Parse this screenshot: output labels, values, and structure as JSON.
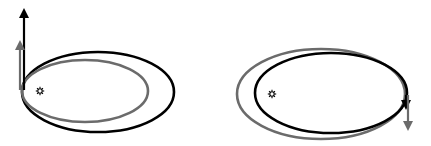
{
  "diagram": {
    "panels": [
      {
        "id": "left",
        "label": "Velocity boost at perihelion",
        "sun": {
          "x": 40,
          "y": 91
        },
        "orbits": [
          {
            "name": "outer-orbit",
            "color": "#000000",
            "cx": 98,
            "cy": 92,
            "rx": 76,
            "ry": 40,
            "stroke_width": 2.6
          },
          {
            "name": "inner-orbit",
            "color": "#6b6b6b",
            "cx": 85,
            "cy": 91,
            "rx": 63,
            "ry": 31,
            "stroke_width": 2.6
          }
        ],
        "arrows": [
          {
            "name": "long-velocity-arrow",
            "color": "#000000",
            "x1": 24,
            "y1": 90,
            "x2": 24,
            "y2": 8,
            "direction": "up"
          },
          {
            "name": "short-velocity-arrow",
            "color": "#6b6b6b",
            "x1": 20,
            "y1": 90,
            "x2": 20,
            "y2": 40,
            "direction": "up"
          }
        ]
      },
      {
        "id": "right",
        "label": "Velocity change at aphelion",
        "sun": {
          "x": 272,
          "y": 94
        },
        "orbits": [
          {
            "name": "outer-orbit",
            "color": "#6b6b6b",
            "cx": 321,
            "cy": 94,
            "rx": 84,
            "ry": 45,
            "stroke_width": 2.6
          },
          {
            "name": "inner-orbit",
            "color": "#000000",
            "cx": 331,
            "cy": 93,
            "rx": 76,
            "ry": 40,
            "stroke_width": 2.6
          }
        ],
        "arrows": [
          {
            "name": "short-velocity-arrow",
            "color": "#000000",
            "x1": 406,
            "y1": 95,
            "x2": 406,
            "y2": 110,
            "direction": "down"
          },
          {
            "name": "long-velocity-arrow",
            "color": "#6b6b6b",
            "x1": 408,
            "y1": 95,
            "x2": 408,
            "y2": 131,
            "direction": "down"
          }
        ]
      }
    ],
    "colors": {
      "primary": "#000000",
      "secondary": "#6b6b6b",
      "background": "#ffffff"
    }
  }
}
